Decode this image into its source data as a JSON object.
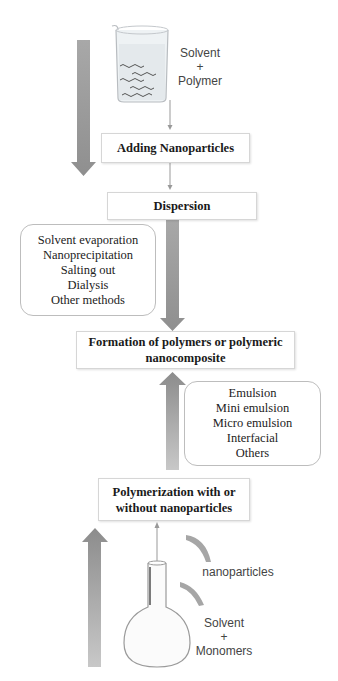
{
  "diagram": {
    "top": {
      "beaker_label": [
        "Solvent",
        "+",
        "Polymer"
      ],
      "steps": [
        {
          "id": "adding",
          "label": "Adding  Nanoparticles"
        },
        {
          "id": "dispersion",
          "label": "Dispersion"
        }
      ],
      "methods_box": {
        "items": [
          "Solvent evaporation",
          "Nanoprecipitation",
          "Salting  out",
          "Dialysis",
          "Other methods"
        ]
      }
    },
    "center": {
      "label_line1": "Formation  of polymers or polymeric",
      "label_line2": "nanocomposite"
    },
    "bottom": {
      "polymerization_methods_box": {
        "items": [
          "Emulsion",
          "Mini  emulsion",
          "Micro emulsion",
          "Interfacial",
          "Others"
        ]
      },
      "step": {
        "label_line1": "Polymerization with or",
        "label_line2": "without nanoparticles"
      },
      "nanoparticles_label": "nanoparticles",
      "flask_label": [
        "Solvent",
        "+",
        "Monomers"
      ]
    },
    "colors": {
      "arrow_gray": "#9a9a9a",
      "box_border": "#d6d6d6",
      "rounded_border": "#bdbdbd",
      "text": "#1a1a1a"
    }
  }
}
